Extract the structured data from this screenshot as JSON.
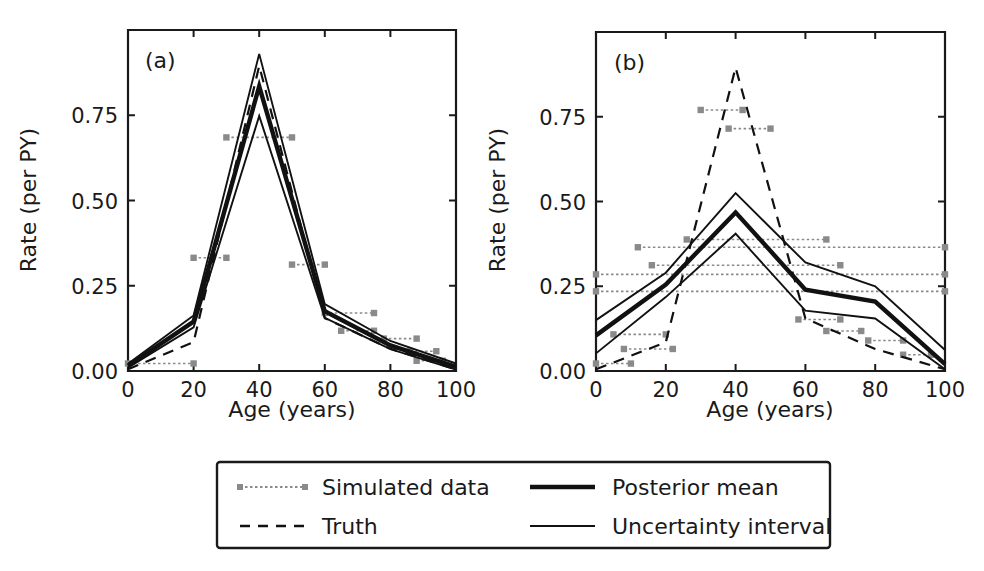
{
  "figure": {
    "background": "#ffffff",
    "ink": "#1a1a1a",
    "sim_color": "#8a8a8a"
  },
  "legend": {
    "items": [
      {
        "key": "simulated",
        "label": "Simulated data",
        "style": "dotted-with-square-caps",
        "color": "#8a8a8a"
      },
      {
        "key": "posterior_mean",
        "label": "Posterior mean",
        "style": "thick-solid",
        "color": "#111111"
      },
      {
        "key": "truth",
        "label": "Truth",
        "style": "dashed",
        "color": "#111111"
      },
      {
        "key": "uncertainty",
        "label": "Uncertainty interval",
        "style": "thin-solid",
        "color": "#111111"
      }
    ]
  },
  "chart_data": [
    {
      "type": "line",
      "panel": "a",
      "panel_tag": "(a)",
      "title": "",
      "xlabel": "Age (years)",
      "ylabel": "Rate (per PY)",
      "xlim": [
        0,
        100
      ],
      "ylim": [
        0.0,
        1.0
      ],
      "xticks": [
        0,
        20,
        40,
        60,
        80,
        100
      ],
      "xtick_labels": [
        "0",
        "20",
        "40",
        "60",
        "80",
        "100"
      ],
      "yticks": [
        0.0,
        0.25,
        0.5,
        0.75
      ],
      "ytick_labels": [
        "0.00",
        "0.25",
        "0.50",
        "0.75"
      ],
      "grid": false,
      "legend_position": "below-figure",
      "x": [
        0,
        20,
        40,
        60,
        80,
        100
      ],
      "series": [
        {
          "name": "Truth",
          "style": "dashed",
          "values": [
            0.005,
            0.085,
            0.895,
            0.155,
            0.065,
            0.005
          ]
        },
        {
          "name": "Posterior mean",
          "style": "thick-solid",
          "values": [
            0.015,
            0.145,
            0.835,
            0.175,
            0.075,
            0.012
          ]
        },
        {
          "name": "Uncertainty interval upper",
          "style": "thin-solid",
          "values": [
            0.021,
            0.163,
            0.93,
            0.196,
            0.088,
            0.022
          ]
        },
        {
          "name": "Uncertainty interval lower",
          "style": "thin-solid",
          "values": [
            0.01,
            0.128,
            0.748,
            0.156,
            0.064,
            0.004
          ]
        }
      ],
      "simulated_data": [
        {
          "x_start": 0,
          "x_end": 20,
          "value": 0.022
        },
        {
          "x_start": 20,
          "x_end": 30,
          "value": 0.332
        },
        {
          "x_start": 30,
          "x_end": 50,
          "value": 0.685
        },
        {
          "x_start": 50,
          "x_end": 60,
          "value": 0.312
        },
        {
          "x_start": 60,
          "x_end": 75,
          "value": 0.17
        },
        {
          "x_start": 65,
          "x_end": 75,
          "value": 0.118
        },
        {
          "x_start": 78,
          "x_end": 88,
          "value": 0.095
        },
        {
          "x_start": 86,
          "x_end": 94,
          "value": 0.058
        },
        {
          "x_start": 88,
          "x_end": 96,
          "value": 0.03
        }
      ]
    },
    {
      "type": "line",
      "panel": "b",
      "panel_tag": "(b)",
      "title": "",
      "xlabel": "Age (years)",
      "ylabel": "Rate (per PY)",
      "xlim": [
        0,
        100
      ],
      "ylim": [
        0.0,
        1.0
      ],
      "xticks": [
        0,
        20,
        40,
        60,
        80,
        100
      ],
      "xtick_labels": [
        "0",
        "20",
        "40",
        "60",
        "80",
        "100"
      ],
      "yticks": [
        0.0,
        0.25,
        0.5,
        0.75
      ],
      "ytick_labels": [
        "0.00",
        "0.25",
        "0.50",
        "0.75"
      ],
      "grid": false,
      "legend_position": "below-figure",
      "x": [
        0,
        20,
        40,
        60,
        80,
        100
      ],
      "series": [
        {
          "name": "Truth",
          "style": "dashed",
          "values": [
            0.005,
            0.085,
            0.895,
            0.155,
            0.065,
            0.005
          ]
        },
        {
          "name": "Posterior mean",
          "style": "thick-solid",
          "values": [
            0.105,
            0.255,
            0.468,
            0.24,
            0.205,
            0.02
          ]
        },
        {
          "name": "Uncertainty interval upper",
          "style": "thin-solid",
          "values": [
            0.15,
            0.29,
            0.525,
            0.32,
            0.25,
            0.062
          ]
        },
        {
          "name": "Uncertainty interval lower",
          "style": "thin-solid",
          "values": [
            0.052,
            0.218,
            0.405,
            0.178,
            0.155,
            0.005
          ]
        }
      ],
      "simulated_data": [
        {
          "x_start": 0,
          "x_end": 10,
          "value": 0.022
        },
        {
          "x_start": 5,
          "x_end": 20,
          "value": 0.108
        },
        {
          "x_start": 8,
          "x_end": 22,
          "value": 0.065
        },
        {
          "x_start": 0,
          "x_end": 100,
          "value": 0.235
        },
        {
          "x_start": 0,
          "x_end": 100,
          "value": 0.285
        },
        {
          "x_start": 16,
          "x_end": 70,
          "value": 0.312
        },
        {
          "x_start": 12,
          "x_end": 100,
          "value": 0.365
        },
        {
          "x_start": 26,
          "x_end": 66,
          "value": 0.388
        },
        {
          "x_start": 30,
          "x_end": 42,
          "value": 0.77
        },
        {
          "x_start": 38,
          "x_end": 50,
          "value": 0.715
        },
        {
          "x_start": 58,
          "x_end": 70,
          "value": 0.152
        },
        {
          "x_start": 66,
          "x_end": 76,
          "value": 0.118
        },
        {
          "x_start": 78,
          "x_end": 88,
          "value": 0.09
        },
        {
          "x_start": 88,
          "x_end": 96,
          "value": 0.048
        }
      ]
    }
  ]
}
